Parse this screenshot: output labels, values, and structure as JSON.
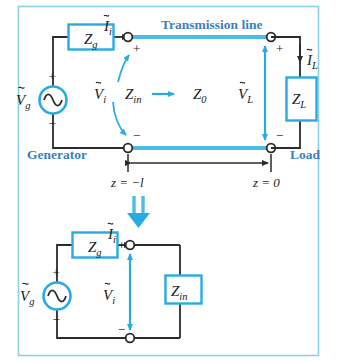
{
  "figure": {
    "frame_color": "#8ecfe8",
    "wire_color": "#2b2b2b",
    "accent_color": "#29abe2",
    "label_blue": "#3a7fc1",
    "box_fill": "#ffffff",
    "node_fill": "#ffffff"
  },
  "top_circuit": {
    "name": "transmission-line-circuit",
    "labels": {
      "transmission_line": "Transmission line",
      "generator": "Generator",
      "load": "Load",
      "z_source": "Z",
      "z_source_sub": "g",
      "v_source": "V",
      "v_source_sub": "g",
      "current_in": "I",
      "current_in_sub": "i",
      "voltage_in": "V",
      "voltage_in_sub": "i",
      "z_in": "Z",
      "z_in_sub": "in",
      "z_char": "Z",
      "z_char_sub": "0",
      "voltage_load": "V",
      "voltage_load_sub": "L",
      "current_load": "I",
      "current_load_sub": "L",
      "z_load": "Z",
      "z_load_sub": "L",
      "plus_in": "+",
      "minus_in": "−",
      "plus_source": "+",
      "minus_source": "−",
      "plus_load": "+",
      "minus_load": "−"
    },
    "dimension": {
      "left_label": "z = −l",
      "right_label": "z = 0",
      "left_label_plain": "z =",
      "left_label_italic": "−l",
      "right_label_plain": "z =",
      "right_label_value": "0"
    }
  },
  "transform_arrow": {
    "name": "double-down-arrow",
    "direction": "down",
    "color": "#29abe2"
  },
  "bottom_circuit": {
    "name": "equivalent-input-impedance-circuit",
    "labels": {
      "z_source": "Z",
      "z_source_sub": "g",
      "v_source": "V",
      "v_source_sub": "g",
      "current_in": "I",
      "current_in_sub": "i",
      "voltage_in": "V",
      "voltage_in_sub": "i",
      "z_in": "Z",
      "z_in_sub": "in",
      "plus_in": "+",
      "minus_in": "−",
      "plus_source": "+",
      "minus_source": "−"
    }
  }
}
